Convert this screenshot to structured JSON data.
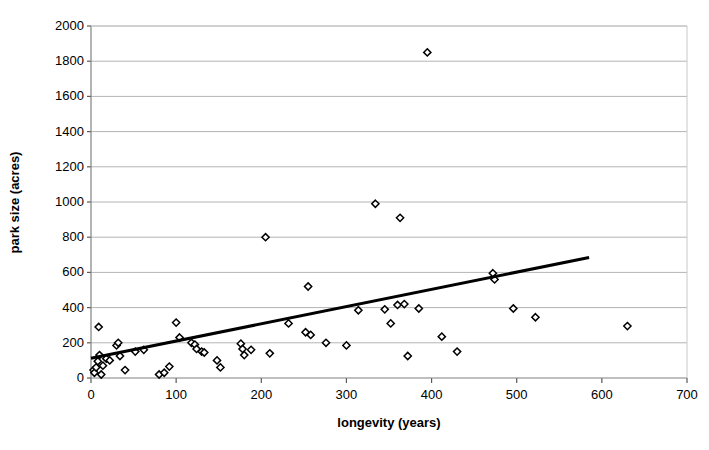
{
  "chart_data": {
    "type": "scatter",
    "title": "",
    "xlabel": "longevity (years)",
    "ylabel": "park size (acres)",
    "xlim": [
      0,
      700
    ],
    "ylim": [
      0,
      2000
    ],
    "xticks": [
      0,
      100,
      200,
      300,
      400,
      500,
      600,
      700
    ],
    "yticks": [
      0,
      200,
      400,
      600,
      800,
      1000,
      1200,
      1400,
      1600,
      1800,
      2000
    ],
    "grid": "horizontal",
    "legend": "none",
    "marker": "open-diamond",
    "marker_color": "#000000",
    "points": [
      {
        "x": 3,
        "y": 45
      },
      {
        "x": 4,
        "y": 30
      },
      {
        "x": 6,
        "y": 60
      },
      {
        "x": 8,
        "y": 95
      },
      {
        "x": 9,
        "y": 290
      },
      {
        "x": 10,
        "y": 130
      },
      {
        "x": 12,
        "y": 20
      },
      {
        "x": 14,
        "y": 70
      },
      {
        "x": 18,
        "y": 110
      },
      {
        "x": 22,
        "y": 100
      },
      {
        "x": 30,
        "y": 185
      },
      {
        "x": 32,
        "y": 200
      },
      {
        "x": 34,
        "y": 125
      },
      {
        "x": 40,
        "y": 45
      },
      {
        "x": 52,
        "y": 150
      },
      {
        "x": 62,
        "y": 160
      },
      {
        "x": 80,
        "y": 20
      },
      {
        "x": 86,
        "y": 30
      },
      {
        "x": 92,
        "y": 65
      },
      {
        "x": 100,
        "y": 315
      },
      {
        "x": 104,
        "y": 230
      },
      {
        "x": 118,
        "y": 200
      },
      {
        "x": 122,
        "y": 190
      },
      {
        "x": 124,
        "y": 165
      },
      {
        "x": 130,
        "y": 150
      },
      {
        "x": 133,
        "y": 145
      },
      {
        "x": 148,
        "y": 100
      },
      {
        "x": 152,
        "y": 60
      },
      {
        "x": 176,
        "y": 195
      },
      {
        "x": 178,
        "y": 165
      },
      {
        "x": 180,
        "y": 130
      },
      {
        "x": 188,
        "y": 160
      },
      {
        "x": 205,
        "y": 800
      },
      {
        "x": 210,
        "y": 140
      },
      {
        "x": 232,
        "y": 310
      },
      {
        "x": 252,
        "y": 260
      },
      {
        "x": 255,
        "y": 520
      },
      {
        "x": 258,
        "y": 245
      },
      {
        "x": 276,
        "y": 200
      },
      {
        "x": 300,
        "y": 185
      },
      {
        "x": 314,
        "y": 385
      },
      {
        "x": 334,
        "y": 990
      },
      {
        "x": 345,
        "y": 390
      },
      {
        "x": 352,
        "y": 310
      },
      {
        "x": 360,
        "y": 415
      },
      {
        "x": 363,
        "y": 910
      },
      {
        "x": 368,
        "y": 420
      },
      {
        "x": 372,
        "y": 125
      },
      {
        "x": 385,
        "y": 395
      },
      {
        "x": 395,
        "y": 1850
      },
      {
        "x": 412,
        "y": 235
      },
      {
        "x": 430,
        "y": 150
      },
      {
        "x": 472,
        "y": 595
      },
      {
        "x": 474,
        "y": 560
      },
      {
        "x": 496,
        "y": 395
      },
      {
        "x": 522,
        "y": 345
      },
      {
        "x": 630,
        "y": 295
      }
    ],
    "trendline": {
      "x_start": 0,
      "y_start": 112,
      "x_end": 585,
      "y_end": 685,
      "color": "#000000",
      "width": 3
    }
  }
}
